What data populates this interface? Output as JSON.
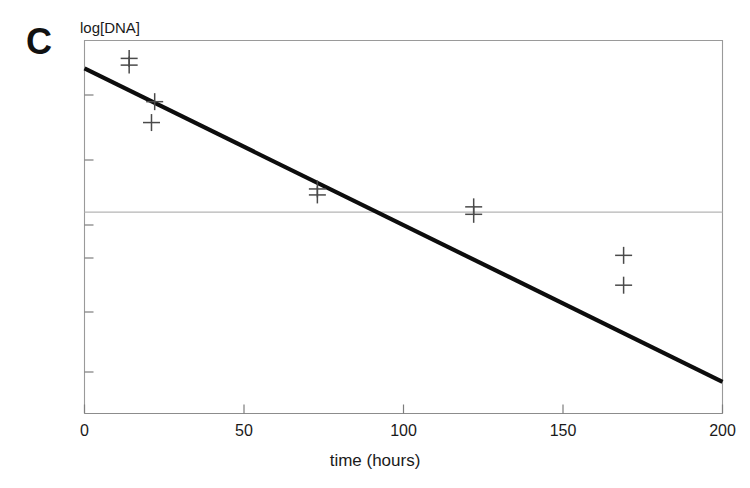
{
  "figure": {
    "panel_label": "C",
    "background_color": "#ffffff"
  },
  "chart_data": {
    "type": "scatter",
    "title": "",
    "xlabel": "time (hours)",
    "ylabel": "log[DNA]",
    "xlim": [
      0,
      200
    ],
    "ylim": [
      0,
      1
    ],
    "xticks": [
      0,
      50,
      100,
      150,
      200
    ],
    "xtick_labels": [
      "0",
      "50",
      "100",
      "150",
      "200"
    ],
    "yticks": [],
    "ytick_labels": [],
    "grid": "single horizontal reference line at y = 0.54",
    "legend": "none",
    "marker_style": "plus-cross",
    "marker_color": "#4a4a4a",
    "line_color": "#0d0d0d",
    "grid_color": "#b5b5b5",
    "frame_color": "#9a9a9a",
    "gridlines_y": [
      0.54
    ],
    "series": [
      {
        "name": "log[DNA] measurements",
        "marker": "plus",
        "points": [
          {
            "x": 14,
            "y": 0.952
          },
          {
            "x": 14,
            "y": 0.934
          },
          {
            "x": 22,
            "y": 0.836
          },
          {
            "x": 21,
            "y": 0.78
          },
          {
            "x": 73,
            "y": 0.602
          },
          {
            "x": 73,
            "y": 0.586
          },
          {
            "x": 122,
            "y": 0.554
          },
          {
            "x": 122,
            "y": 0.534
          },
          {
            "x": 169,
            "y": 0.424
          },
          {
            "x": 169,
            "y": 0.344
          }
        ]
      }
    ],
    "fit_line": {
      "name": "linear regression fit",
      "x_start": 0,
      "y_start": 0.925,
      "x_end": 200,
      "y_end": 0.085
    }
  }
}
